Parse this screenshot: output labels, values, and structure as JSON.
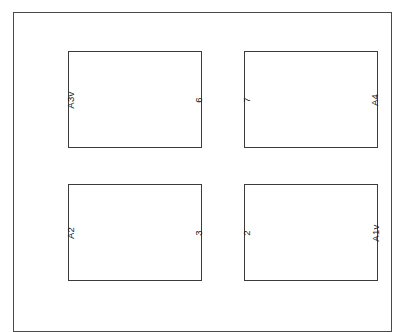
{
  "diagram": {
    "type": "panel-grid-layout",
    "frame": {
      "label": "outer-page-frame"
    },
    "edge_note": {
      "text": ""
    },
    "panels": [
      {
        "id": "panel-0",
        "left_label": "A3v",
        "right_label": "6",
        "row": 0,
        "col": 0
      },
      {
        "id": "panel-1",
        "left_label": "7",
        "right_label": "A4",
        "row": 0,
        "col": 1
      },
      {
        "id": "panel-2",
        "left_label": "A2",
        "right_label": "3",
        "row": 1,
        "col": 0
      },
      {
        "id": "panel-3",
        "left_label": "2",
        "right_label": "A1v",
        "row": 1,
        "col": 1
      }
    ],
    "colors": {
      "background": "#ffffff",
      "frame_stroke": "#4a4a4a",
      "panel_stroke": "#3c3c3c",
      "label_text": "#1a1a1a",
      "edge_note_text": "#cfcfcf"
    }
  }
}
